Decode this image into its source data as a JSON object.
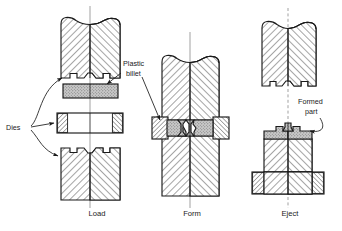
{
  "figure": {
    "type": "engineering-process-diagram",
    "background_color": "#ffffff",
    "line_color": "#1a1a1a",
    "hatch_color": "#2b2b2b",
    "billet_fill": "#b3b3b3",
    "part_fill": "#b8b8b8",
    "stages": [
      {
        "id": "load",
        "caption": "Load",
        "caption_x": 97,
        "caption_y": 216,
        "axis_x": 90,
        "axis_top": 6,
        "axis_bottom": 208
      },
      {
        "id": "form",
        "caption": "Form",
        "caption_x": 192,
        "caption_y": 216,
        "axis_x": 190,
        "axis_top": 32,
        "axis_bottom": 208
      },
      {
        "id": "eject",
        "caption": "Eject",
        "caption_x": 290,
        "caption_y": 216,
        "axis_x": 288,
        "axis_top": 8,
        "axis_bottom": 208
      }
    ],
    "annotations": [
      {
        "id": "plastic-billet",
        "line1": "Plastic",
        "line2": "billet",
        "x": 123,
        "y": 66,
        "y2": 76
      },
      {
        "id": "dies",
        "text": "Dies",
        "x": 6,
        "y": 127
      },
      {
        "id": "formed-part",
        "line1": "Formed",
        "line2": "part",
        "x": 298,
        "y": 104,
        "y2": 114
      }
    ]
  }
}
